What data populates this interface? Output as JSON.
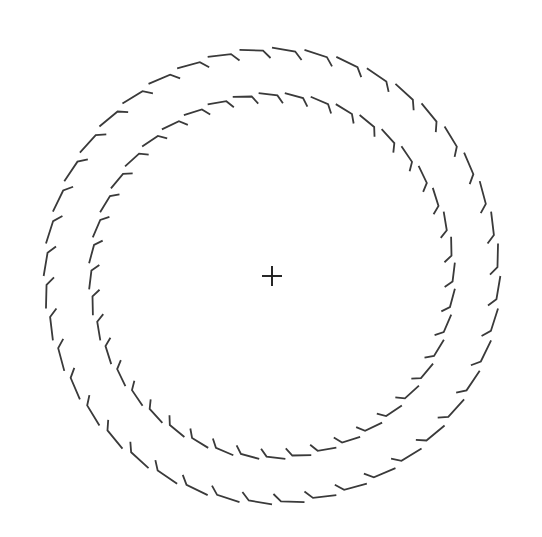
{
  "figure": {
    "type": "line-drawing",
    "background_color": "#ffffff",
    "width": 542,
    "height": 537,
    "stroke_color": "#3a3a3a",
    "center": {
      "x": 272,
      "y": 276
    },
    "center_mark": {
      "name": "plus",
      "arm_length": 10,
      "stroke_width": 1.9,
      "color": "#1c1c1c"
    },
    "rings": [
      {
        "id": "outer-ring",
        "label": "Outer dashed ring",
        "radius": 227,
        "dash_count": 44,
        "stroke_width": 1.8,
        "color": "#3a3a3a",
        "dash_arc_degrees": 5.9,
        "hook_arc_degrees": 1.9,
        "hook_radial_offset": 9,
        "phase_degrees": -90
      },
      {
        "id": "inner-ring",
        "label": "Inner dashed ring",
        "radius": 182,
        "dash_count": 44,
        "stroke_width": 1.8,
        "color": "#3a3a3a",
        "dash_arc_degrees": 5.9,
        "hook_arc_degrees": 1.9,
        "hook_radial_offset": 9,
        "phase_degrees": -86
      }
    ]
  },
  "chart_data": {
    "type": "scatter",
    "xlabel": "",
    "ylabel": "",
    "xlim": [
      0,
      542
    ],
    "ylim": [
      0,
      537
    ],
    "grid": false,
    "legend": "none",
    "annotations": [
      "Two concentric rings drawn as bent (chevron/hook) dash segments",
      "Small plus-shaped fiducial mark at the centre"
    ],
    "series": [
      {
        "name": "outer-ring",
        "shape": "circle",
        "cx": 272,
        "cy": 276,
        "r": 227,
        "segments": 44
      },
      {
        "name": "inner-ring",
        "shape": "circle",
        "cx": 272,
        "cy": 276,
        "r": 182,
        "segments": 44
      },
      {
        "name": "center-mark",
        "shape": "plus",
        "cx": 272,
        "cy": 276,
        "size": 20
      }
    ]
  }
}
